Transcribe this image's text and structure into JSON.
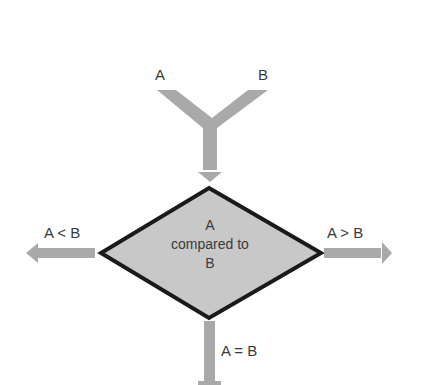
{
  "diagram": {
    "type": "flowchart-decision",
    "inputs": {
      "left_label": "A",
      "right_label": "B"
    },
    "decision": {
      "line1": "A",
      "line2": "compared to",
      "line3": "B"
    },
    "outputs": {
      "left_label": "A < B",
      "right_label": "A > B",
      "bottom_label": "A = B"
    },
    "colors": {
      "arrow": "#a9a9a9",
      "diamond_fill": "#c8c8c8",
      "diamond_stroke": "#1a1a1a",
      "text": "#3a3a3a"
    }
  }
}
